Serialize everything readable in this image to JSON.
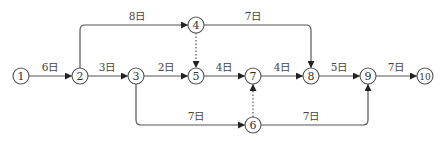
{
  "diagram": {
    "type": "arrow-network",
    "colors": {
      "line": "#555555",
      "text": "#333333",
      "background": "#ffffff"
    },
    "nodes": [
      {
        "id": "1",
        "label": "1",
        "x": 21,
        "y": 76
      },
      {
        "id": "2",
        "label": "2",
        "x": 80,
        "y": 76
      },
      {
        "id": "3",
        "label": "3",
        "x": 136,
        "y": 76
      },
      {
        "id": "4",
        "label": "4",
        "x": 196,
        "y": 25
      },
      {
        "id": "5",
        "label": "5",
        "x": 196,
        "y": 76
      },
      {
        "id": "6",
        "label": "6",
        "x": 253,
        "y": 125
      },
      {
        "id": "7",
        "label": "7",
        "x": 253,
        "y": 76
      },
      {
        "id": "8",
        "label": "8",
        "x": 311,
        "y": 76
      },
      {
        "id": "9",
        "label": "9",
        "x": 368,
        "y": 76
      },
      {
        "id": "10",
        "label": "10",
        "x": 425,
        "y": 76
      }
    ],
    "edges": [
      {
        "from": "1",
        "to": "2",
        "label": "6日",
        "dummy": false
      },
      {
        "from": "2",
        "to": "3",
        "label": "3日",
        "dummy": false
      },
      {
        "from": "2",
        "to": "4",
        "label": "8日",
        "dummy": false
      },
      {
        "from": "3",
        "to": "5",
        "label": "2日",
        "dummy": false
      },
      {
        "from": "3",
        "to": "6",
        "label": "7日",
        "dummy": false
      },
      {
        "from": "4",
        "to": "5",
        "label": "",
        "dummy": true
      },
      {
        "from": "4",
        "to": "8",
        "label": "7日",
        "dummy": false
      },
      {
        "from": "5",
        "to": "7",
        "label": "4日",
        "dummy": false
      },
      {
        "from": "6",
        "to": "7",
        "label": "",
        "dummy": true
      },
      {
        "from": "6",
        "to": "9",
        "label": "7日",
        "dummy": false
      },
      {
        "from": "7",
        "to": "8",
        "label": "4日",
        "dummy": false
      },
      {
        "from": "8",
        "to": "9",
        "label": "5日",
        "dummy": false
      },
      {
        "from": "9",
        "to": "10",
        "label": "7日",
        "dummy": false
      }
    ]
  }
}
